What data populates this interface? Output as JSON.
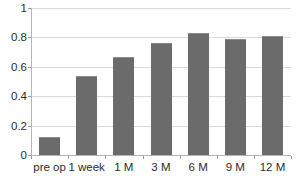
{
  "chart_data": {
    "type": "bar",
    "title": "",
    "subtitle": "",
    "xlabel": "",
    "ylabel": "",
    "categories": [
      "pre op",
      "1 week",
      "1 M",
      "3 M",
      "6 M",
      "9 M",
      "12 M"
    ],
    "values": [
      0.125,
      0.535,
      0.665,
      0.765,
      0.83,
      0.79,
      0.81
    ],
    "series": [
      {
        "name": "",
        "values": [
          0.125,
          0.535,
          0.665,
          0.765,
          0.83,
          0.79,
          0.81
        ]
      }
    ],
    "ylim": [
      0,
      1
    ],
    "xlim": [
      0,
      7
    ],
    "y_ticks": [
      0,
      0.2,
      0.4,
      0.6,
      0.8,
      1
    ],
    "y_tick_labels": [
      "0",
      "0.2",
      "0.4",
      "0.6",
      "0.8",
      "1"
    ],
    "x_tick_labels": [
      "pre op",
      "1 week",
      "1 M",
      "3 M",
      "6 M",
      "9 M",
      "12 M"
    ],
    "grid": true,
    "grid_axis": "y",
    "legend": false,
    "legend_position": "none",
    "annotations": [],
    "colors": {
      "bar_fill": "#6b6b6b",
      "bar_edge": "#8a8a8a",
      "gridline": "#d9d9d9",
      "axis": "#b5b5b5",
      "text": "#2b2b2b",
      "background": "#ffffff"
    }
  }
}
